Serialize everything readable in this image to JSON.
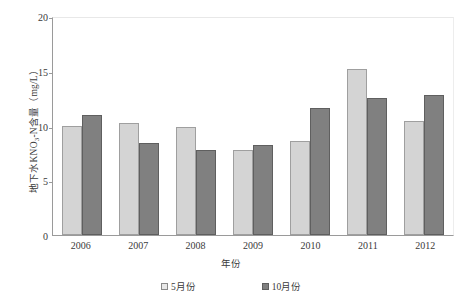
{
  "chart_data": {
    "type": "bar",
    "title": "",
    "xlabel": "年份",
    "ylabel": "地下水KNO3-N含量（mg/L）",
    "ylabel_parts": {
      "prefix": "地下水KNO",
      "sub": "3",
      "suffix": "-N含量（mg/L）"
    },
    "categories": [
      "2006",
      "2007",
      "2008",
      "2009",
      "2010",
      "2011",
      "2012"
    ],
    "yticks": [
      "0",
      "5",
      "10",
      "15",
      "20"
    ],
    "ylim": [
      0,
      20
    ],
    "grid": false,
    "legend_position": "bottom",
    "series": [
      {
        "name": "5月份",
        "color": "#d4d4d4",
        "values": [
          10.0,
          10.2,
          9.9,
          7.8,
          8.6,
          15.2,
          10.4
        ]
      },
      {
        "name": "10月份",
        "color": "#808080",
        "values": [
          11.0,
          8.4,
          7.8,
          8.2,
          11.6,
          12.5,
          12.8
        ]
      }
    ]
  }
}
